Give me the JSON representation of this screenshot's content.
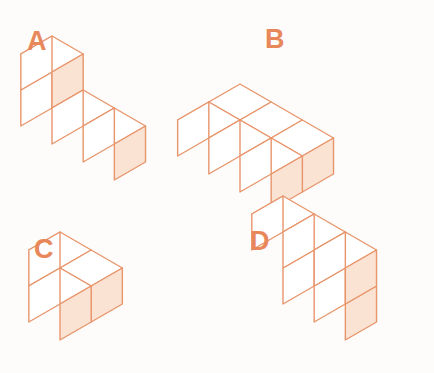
{
  "page": {
    "background_color": "#fdfcfa",
    "width": 434,
    "height": 373
  },
  "style": {
    "stroke_color": "#e8956b",
    "stroke_color_light": "#edae8c",
    "stroke_width": 1.4,
    "face_top_color": "#ffffff",
    "face_left_color": "#ffffff",
    "face_right_color": "#fbe3d4",
    "label_color": "#e8885a",
    "label_font_size": 27
  },
  "figures": [
    {
      "id": "A",
      "label": "A",
      "label_x": 27,
      "label_y": 50,
      "cube_count": 4,
      "description": "L-shaped solid: a row of three cubes with one cube stacked on the rear-left cube",
      "origin_x": 52,
      "origin_y": 108,
      "cube_size": 36,
      "cells": [
        {
          "x": 0,
          "y": 0,
          "z": 0
        },
        {
          "x": 1,
          "y": 0,
          "z": 0
        },
        {
          "x": 2,
          "y": 0,
          "z": 0
        },
        {
          "x": 0,
          "y": 0,
          "z": 1
        }
      ]
    },
    {
      "id": "B",
      "label": "B",
      "label_x": 265,
      "label_y": 48,
      "cube_count": 6,
      "description": "Flat arrangement two deep and three wide with a notch, forming a zig-zag front face",
      "origin_x": 240,
      "origin_y": 120,
      "cube_size": 36,
      "cells": [
        {
          "x": 0,
          "y": 0,
          "z": 0
        },
        {
          "x": 1,
          "y": 0,
          "z": 0
        },
        {
          "x": 2,
          "y": 0,
          "z": 0
        },
        {
          "x": 0,
          "y": 1,
          "z": 0
        },
        {
          "x": 1,
          "y": 1,
          "z": 0
        },
        {
          "x": 2,
          "y": 1,
          "z": 0
        }
      ]
    },
    {
      "id": "C",
      "label": "C",
      "label_x": 34,
      "label_y": 258,
      "cube_count": 3,
      "description": "Flat L-shaped solid of three cubes lying in one layer",
      "origin_x": 60,
      "origin_y": 268,
      "cube_size": 36,
      "cells": [
        {
          "x": 0,
          "y": 0,
          "z": 0
        },
        {
          "x": 1,
          "y": 0,
          "z": 0
        },
        {
          "x": 1,
          "y": 1,
          "z": 0
        }
      ]
    },
    {
      "id": "D",
      "label": "D",
      "label_x": 250,
      "label_y": 250,
      "cube_count": 5,
      "description": "Upright wall: a top row of three cubes with two cubes below at the right",
      "origin_x": 283,
      "origin_y": 268,
      "cube_size": 36,
      "cells": [
        {
          "x": 0,
          "y": 0,
          "z": 1
        },
        {
          "x": 1,
          "y": 0,
          "z": 1
        },
        {
          "x": 2,
          "y": 0,
          "z": 1
        },
        {
          "x": 1,
          "y": 0,
          "z": 0
        },
        {
          "x": 2,
          "y": 0,
          "z": 0
        }
      ]
    }
  ]
}
